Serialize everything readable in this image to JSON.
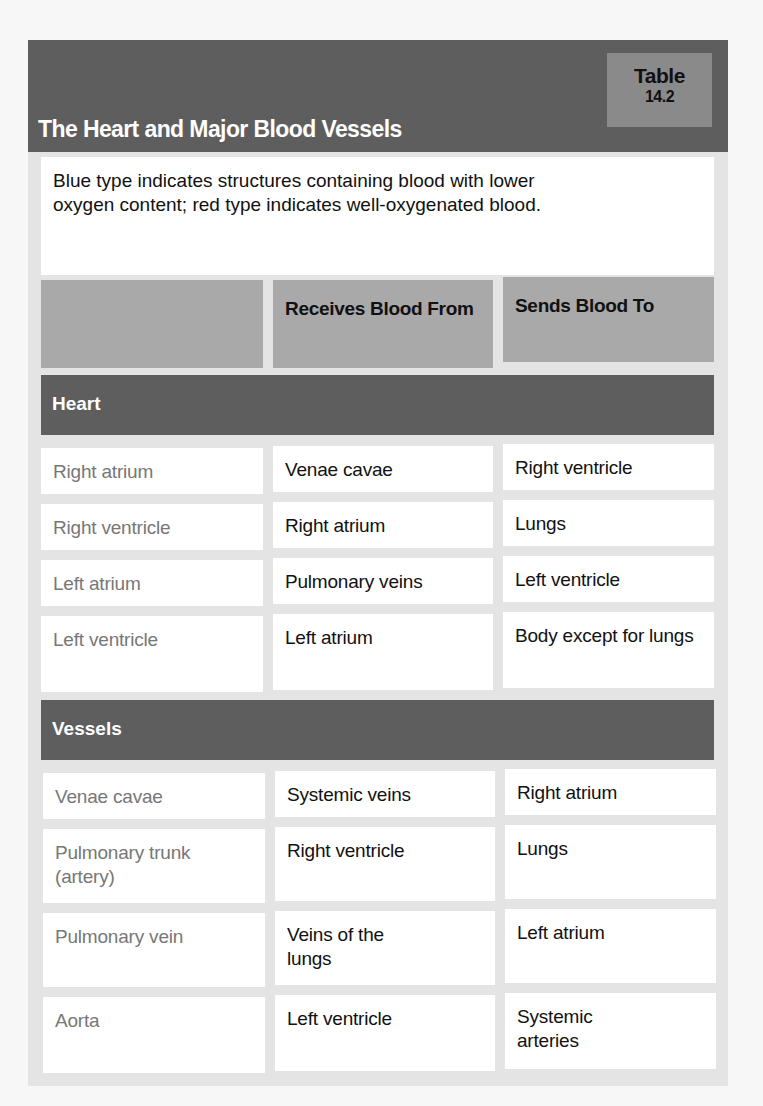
{
  "header": {
    "title": "The Heart and Major Blood Vessels",
    "tag_line1": "Table",
    "tag_line2": "14.2"
  },
  "note": "Blue type indicates structures containing blood with lower oxygen content; red type indicates well-oxygenated blood.",
  "columns": [
    "",
    "Receives Blood From",
    "Sends Blood To"
  ],
  "sections": [
    {
      "label": "Heart",
      "rows": [
        {
          "structure": "Right atrium",
          "receives": "Venae cavae",
          "sends": "Right ventricle"
        },
        {
          "structure": "Right ventricle",
          "receives": "Right atrium",
          "sends": "Lungs"
        },
        {
          "structure": "Left atrium",
          "receives": "Pulmonary veins",
          "sends": "Left ventricle"
        },
        {
          "structure": "Left ventricle",
          "receives": "Left atrium",
          "sends": "Body except for lungs"
        }
      ]
    },
    {
      "label": "Vessels",
      "rows": [
        {
          "structure": "Venae cavae",
          "receives": "Systemic veins",
          "sends": "Right atrium"
        },
        {
          "structure": "Pulmonary trunk (artery)",
          "receives": "Right ventricle",
          "sends": "Lungs"
        },
        {
          "structure": "Pulmonary vein",
          "receives": "Veins of the lungs",
          "sends": "Left atrium"
        },
        {
          "structure": "Aorta",
          "receives": "Left ventricle",
          "sends": "Systemic arteries"
        }
      ]
    }
  ],
  "colors": {
    "title_bar": "#5e5e5e",
    "tag_bg": "#8a8a8a",
    "column_header_bg": "#a9a9a9",
    "structure_text": "#777777"
  }
}
